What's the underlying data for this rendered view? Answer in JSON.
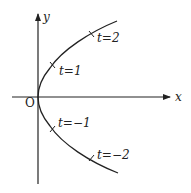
{
  "diagram": {
    "axes": {
      "x_label": "x",
      "y_label": "y",
      "origin_label": "O"
    },
    "curve": "parabola opening right",
    "points": [
      {
        "label": "t=2"
      },
      {
        "label": "t=1"
      },
      {
        "label": "t=−1"
      },
      {
        "label": "t=−2"
      }
    ]
  }
}
